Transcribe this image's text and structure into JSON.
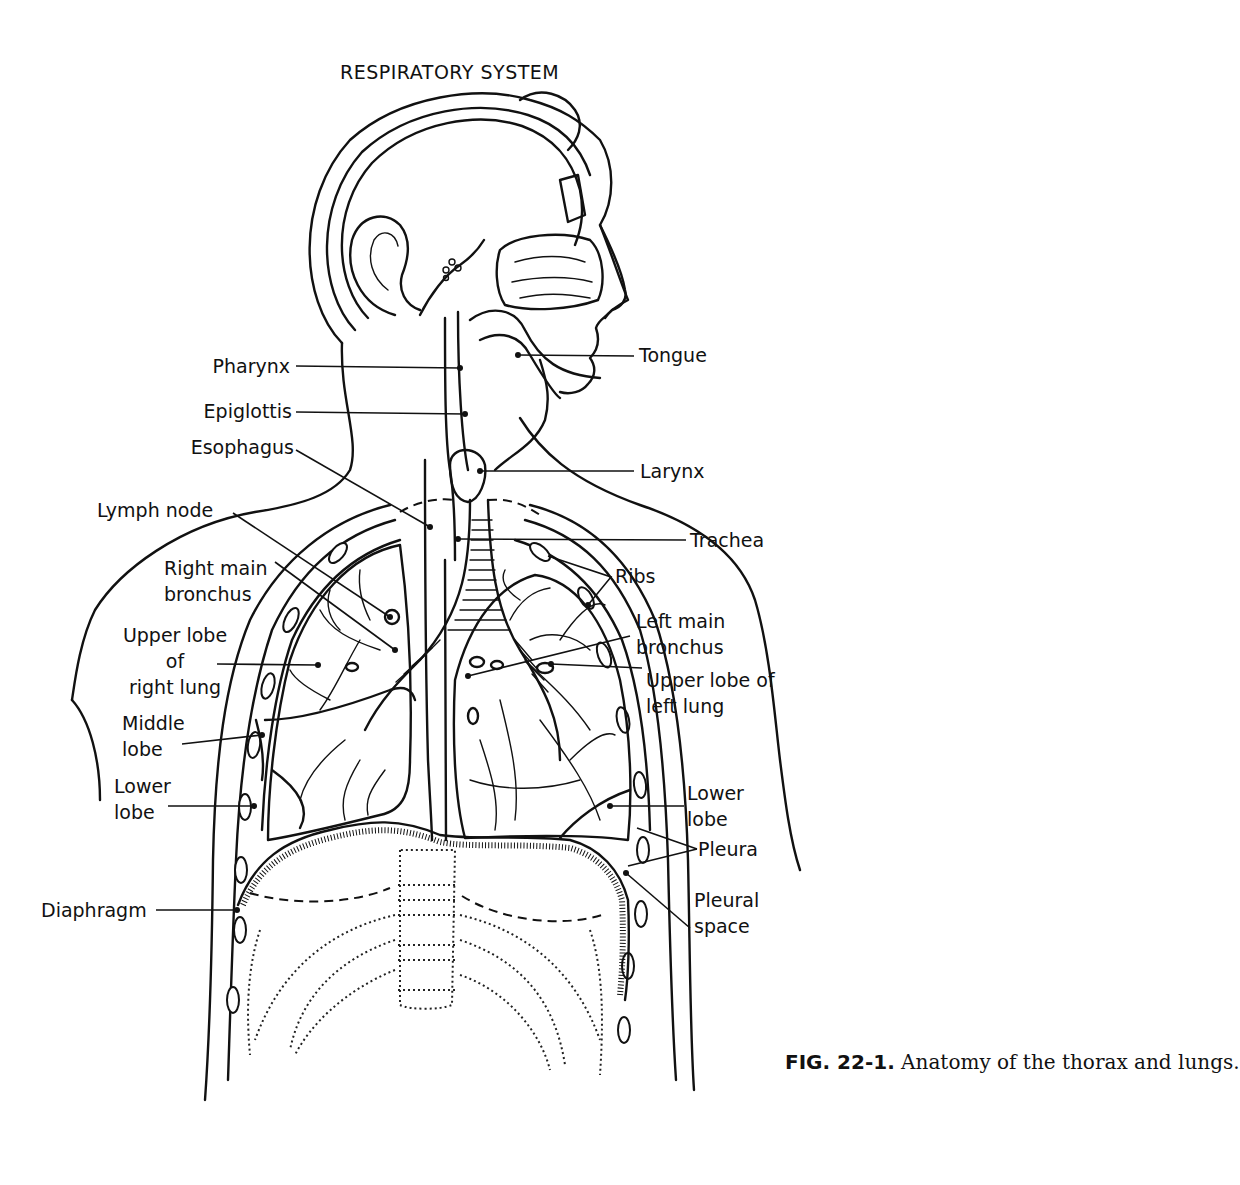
{
  "figure": {
    "title": "RESPIRATORY SYSTEM",
    "caption": {
      "number": "FIG. 22-1.",
      "text": " Anatomy of the thorax and lungs."
    }
  },
  "labels_left": [
    {
      "id": "pharynx",
      "lines": [
        "Pharynx"
      ]
    },
    {
      "id": "epiglottis",
      "lines": [
        "Epiglottis"
      ]
    },
    {
      "id": "esophagus",
      "lines": [
        "Esophagus"
      ]
    },
    {
      "id": "lymph-node",
      "lines": [
        "Lymph node"
      ]
    },
    {
      "id": "right-main-bronchus",
      "lines": [
        "Right main",
        "bronchus"
      ]
    },
    {
      "id": "upper-lobe-right-lung",
      "lines": [
        "Upper lobe",
        "of",
        "right lung"
      ]
    },
    {
      "id": "middle-lobe",
      "lines": [
        "Middle",
        "lobe"
      ]
    },
    {
      "id": "lower-lobe-right",
      "lines": [
        "Lower",
        "lobe"
      ]
    },
    {
      "id": "diaphragm",
      "lines": [
        "Diaphragm"
      ]
    }
  ],
  "labels_right": [
    {
      "id": "tongue",
      "lines": [
        "Tongue"
      ]
    },
    {
      "id": "larynx",
      "lines": [
        "Larynx"
      ]
    },
    {
      "id": "trachea",
      "lines": [
        "Trachea"
      ]
    },
    {
      "id": "ribs",
      "lines": [
        "Ribs"
      ]
    },
    {
      "id": "left-main-bronchus",
      "lines": [
        "Left main",
        "bronchus"
      ]
    },
    {
      "id": "upper-lobe-left-lung",
      "lines": [
        "Upper lobe of",
        "left lung"
      ]
    },
    {
      "id": "lower-lobe-left",
      "lines": [
        "Lower",
        "lobe"
      ]
    },
    {
      "id": "pleura",
      "lines": [
        "Pleura"
      ]
    },
    {
      "id": "pleural-space",
      "lines": [
        "Pleural",
        "space"
      ]
    }
  ],
  "colors": {
    "ink": "#111111",
    "paper": "#ffffff"
  }
}
